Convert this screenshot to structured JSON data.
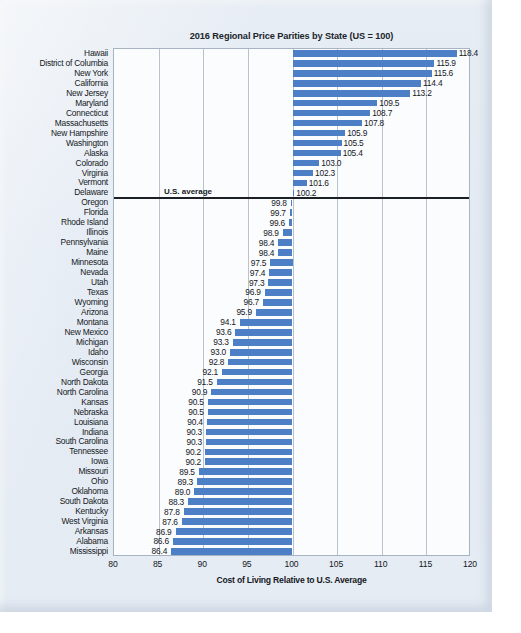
{
  "chart_data": {
    "type": "bar",
    "orientation": "horizontal",
    "title": "2016 Regional Price Parities by State (US = 100)",
    "xlabel": "Cost of Living Relative to U.S. Average",
    "ylabel": "",
    "xlim": [
      80,
      120
    ],
    "xticks": [
      80,
      85,
      90,
      95,
      100,
      105,
      110,
      115,
      120
    ],
    "grid": true,
    "baseline": 100,
    "annotation": "U.S. average",
    "bar_color": "#4d7fc6",
    "categories": [
      "Hawaii",
      "District of Columbia",
      "New York",
      "California",
      "New Jersey",
      "Maryland",
      "Connecticut",
      "Massachusetts",
      "New Hampshire",
      "Washington",
      "Alaska",
      "Colorado",
      "Virginia",
      "Vermont",
      "Delaware",
      "Oregon",
      "Florida",
      "Rhode Island",
      "Illinois",
      "Pennsylvania",
      "Maine",
      "Minnesota",
      "Nevada",
      "Utah",
      "Texas",
      "Wyoming",
      "Arizona",
      "Montana",
      "New Mexico",
      "Michigan",
      "Idaho",
      "Wisconsin",
      "Georgia",
      "North Dakota",
      "North Carolina",
      "Kansas",
      "Nebraska",
      "Louisiana",
      "Indiana",
      "South Carolina",
      "Tennessee",
      "Iowa",
      "Missouri",
      "Ohio",
      "Oklahoma",
      "South Dakota",
      "Kentucky",
      "West Virginia",
      "Arkansas",
      "Alabama",
      "Mississippi"
    ],
    "values": [
      118.4,
      115.9,
      115.6,
      114.4,
      113.2,
      109.5,
      108.7,
      107.8,
      105.9,
      105.5,
      105.4,
      103.0,
      102.3,
      101.6,
      100.2,
      99.8,
      99.7,
      99.6,
      98.9,
      98.4,
      98.4,
      97.5,
      97.4,
      97.3,
      96.9,
      96.7,
      95.9,
      94.1,
      93.6,
      93.3,
      93.0,
      92.8,
      92.1,
      91.5,
      90.9,
      90.5,
      90.5,
      90.4,
      90.3,
      90.3,
      90.2,
      90.2,
      89.5,
      89.3,
      89.0,
      88.3,
      87.8,
      87.6,
      86.9,
      86.6,
      86.4
    ],
    "value_labels": [
      "118.4",
      "115.9",
      "115.6",
      "114.4",
      "113.2",
      "109.5",
      "108.7",
      "107.8",
      "105.9",
      "105.5",
      "105.4",
      "103.0",
      "102.3",
      "101.6",
      "100.2",
      "99.8",
      "99.7",
      "99.6",
      "98.9",
      "98.4",
      "98.4",
      "97.5",
      "97.4",
      "97.3",
      "96.9",
      "96.7",
      "95.9",
      "94.1",
      "93.6",
      "93.3",
      "93.0",
      "92.8",
      "92.1",
      "91.5",
      "90.9",
      "90.5",
      "90.5",
      "90.4",
      "90.3",
      "90.3",
      "90.2",
      "90.2",
      "89.5",
      "89.3",
      "89.0",
      "88.3",
      "87.8",
      "87.6",
      "86.9",
      "86.6",
      "86.4"
    ]
  }
}
